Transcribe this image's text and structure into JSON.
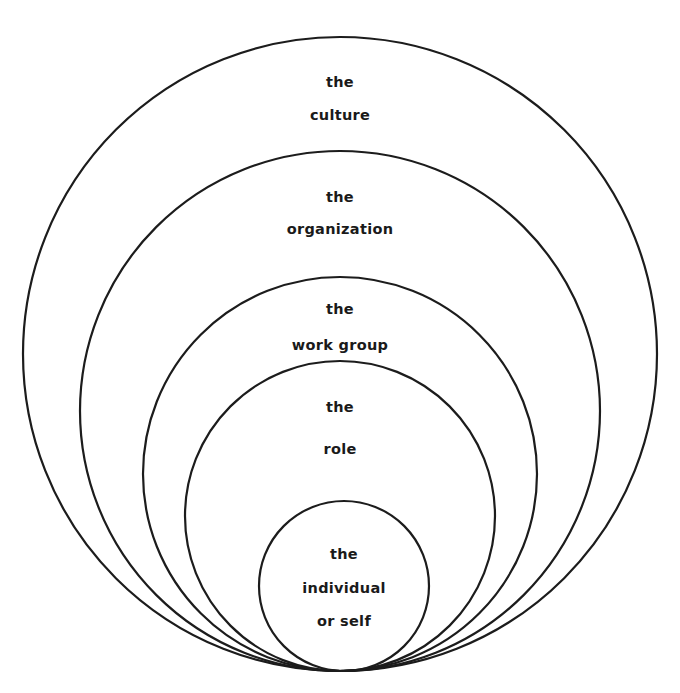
{
  "diagram": {
    "type": "nested-circles",
    "stroke_color": "#1c1c1c",
    "background": "#ffffff",
    "layers": [
      {
        "name": "culture",
        "lines": [
          "the",
          "culture"
        ],
        "cx": 340,
        "cy": 354,
        "r": 317
      },
      {
        "name": "organization",
        "lines": [
          "the",
          "organization"
        ],
        "cx": 340,
        "cy": 411,
        "r": 260
      },
      {
        "name": "work-group",
        "lines": [
          "the",
          "work group"
        ],
        "cx": 340,
        "cy": 474,
        "r": 197
      },
      {
        "name": "role",
        "lines": [
          "the",
          "role"
        ],
        "cx": 340,
        "cy": 516,
        "r": 155
      },
      {
        "name": "individual",
        "lines": [
          "the",
          "individual",
          "or self"
        ],
        "cx": 344,
        "cy": 586,
        "r": 85
      }
    ]
  }
}
